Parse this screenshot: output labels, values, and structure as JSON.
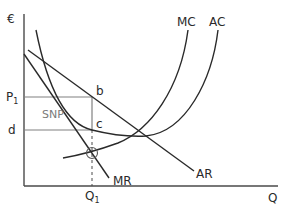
{
  "diagram": {
    "axes": {
      "y_label": "€",
      "x_label": "Q"
    },
    "price_levels": {
      "p1": {
        "label": "P",
        "subscript": "1"
      },
      "d": {
        "label": "d"
      }
    },
    "quantity_levels": {
      "q1": {
        "label": "Q",
        "subscript": "1"
      }
    },
    "points": {
      "b": "b",
      "c": "c"
    },
    "area": {
      "snp": "SNP"
    },
    "curves": {
      "mc": "MC",
      "ac": "AC",
      "ar": "AR",
      "mr": "MR"
    },
    "colors": {
      "curve": "#2a2a2a",
      "axis": "#4a4a4a",
      "guide": "#808080",
      "snp_text": "#7a7a7a"
    }
  }
}
